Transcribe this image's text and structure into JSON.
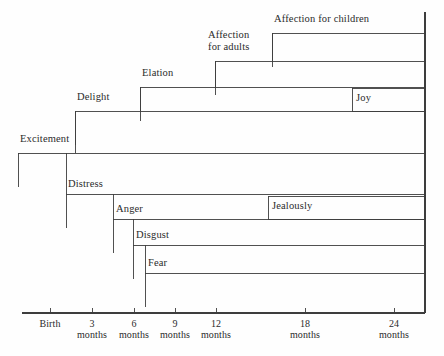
{
  "chart_data": {
    "type": "bar",
    "title": "",
    "subtitle": "",
    "xlabel": "",
    "ylabel": "",
    "orientation": "horizontal",
    "grid": false,
    "legend": "none",
    "xlim": [
      0,
      27
    ],
    "x_unit": "months",
    "axis": {
      "ticks": [
        {
          "value": 0,
          "label": "Birth",
          "unit": "",
          "x": 50
        },
        {
          "value": 3,
          "label": "3",
          "unit": "months",
          "x": 92
        },
        {
          "value": 6,
          "label": "6",
          "unit": "months",
          "x": 134
        },
        {
          "value": 9,
          "label": "9",
          "unit": "months",
          "x": 175
        },
        {
          "value": 12,
          "label": "12",
          "unit": "months",
          "x": 216
        },
        {
          "value": 18,
          "label": "18",
          "unit": "months",
          "x": 305
        },
        {
          "value": 24,
          "label": "24",
          "unit": "months",
          "x": 394
        }
      ],
      "line_y": 313,
      "line_x_start": 22,
      "line_x_end": 425,
      "tick_height": 5
    },
    "categories": [
      "Affection for children",
      "Affection for adults",
      "Elation",
      "Joy",
      "Delight",
      "Excitement",
      "Distress",
      "Jealously",
      "Anger",
      "Disgust",
      "Fear"
    ],
    "values": [
      24,
      21,
      18,
      9,
      15,
      27,
      24,
      18,
      21,
      19,
      18
    ],
    "series": [
      {
        "name": "Onset age (months)",
        "values": [
          18,
          12,
          6,
          21,
          3,
          0,
          3,
          16,
          5,
          6.5,
          7
        ]
      }
    ],
    "bars": [
      {
        "name": "affection-for-children",
        "label": "Affection for children",
        "onset_months": 18,
        "boxed": false,
        "x": 272,
        "y": 33,
        "right": 425,
        "label_x": 274,
        "label_y": 13,
        "label_lines": "Affection for children"
      },
      {
        "name": "affection-for-adults",
        "label": "Affection for adults",
        "onset_months": 12,
        "boxed": false,
        "x": 215,
        "y": 61,
        "right": 425,
        "label_x": 208,
        "label_y": 29,
        "label_lines": "Affection\nfor adults"
      },
      {
        "name": "elation",
        "label": "Elation",
        "onset_months": 6,
        "boxed": false,
        "x": 140,
        "y": 87,
        "right": 425,
        "label_x": 142,
        "label_y": 67,
        "label_lines": "Elation"
      },
      {
        "name": "joy",
        "label": "Joy",
        "onset_months": 21,
        "boxed": true,
        "x": 352,
        "y": 88,
        "y2": 111,
        "right": 425,
        "label_x": 356,
        "label_y": 92,
        "label_lines": "Joy"
      },
      {
        "name": "delight",
        "label": "Delight",
        "onset_months": 3,
        "boxed": false,
        "x": 75,
        "y": 111,
        "right": 425,
        "label_x": 77,
        "label_y": 91,
        "label_lines": "Delight"
      },
      {
        "name": "excitement",
        "label": "Excitement",
        "onset_months": 0,
        "boxed": false,
        "x": 18,
        "y": 153,
        "right": 425,
        "label_x": 20,
        "label_y": 133,
        "label_lines": "Excitement"
      },
      {
        "name": "distress",
        "label": "Distress",
        "onset_months": 3,
        "boxed": false,
        "x": 66,
        "y": 194,
        "right": 425,
        "label_x": 68,
        "label_y": 178,
        "label_lines": "Distress"
      },
      {
        "name": "jealously",
        "label": "Jealously",
        "onset_months": 16,
        "boxed": true,
        "x": 268,
        "y": 196,
        "y2": 219,
        "right": 425,
        "label_x": 272,
        "label_y": 200,
        "label_lines": "Jealously"
      },
      {
        "name": "anger",
        "label": "Anger",
        "onset_months": 5,
        "boxed": false,
        "x": 113,
        "y": 219,
        "right": 425,
        "label_x": 116,
        "label_y": 203,
        "label_lines": "Anger"
      },
      {
        "name": "disgust",
        "label": "Disgust",
        "onset_months": 6.5,
        "boxed": false,
        "x": 133,
        "y": 245,
        "right": 425,
        "label_x": 136,
        "label_y": 229,
        "label_lines": "Disgust"
      },
      {
        "name": "fear",
        "label": "Fear",
        "onset_months": 7,
        "boxed": false,
        "x": 145,
        "y": 273,
        "right": 425,
        "label_x": 148,
        "label_y": 257,
        "label_lines": "Fear"
      }
    ],
    "annotations": [],
    "colors": {
      "background": "#fefefe",
      "line": "#3d3d3d",
      "text": "#2b2b2b"
    }
  }
}
